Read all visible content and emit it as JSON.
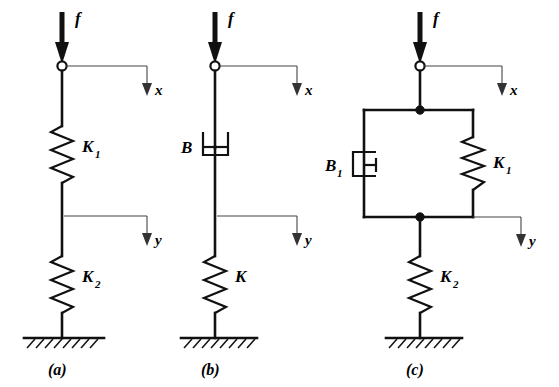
{
  "figure": {
    "background_color": "#ffffff",
    "line_color": "#111111",
    "leader_color": "#444444"
  },
  "panels": [
    {
      "id": "a",
      "caption": "(a)",
      "force_label": "f",
      "input_node": "open-circle",
      "displacement_top": "x",
      "displacement_bottom": "y",
      "elements": [
        {
          "kind": "spring",
          "label": "K",
          "subscript": "1"
        },
        {
          "kind": "spring",
          "label": "K",
          "subscript": "2"
        }
      ],
      "ground": "hatched-fixed-support"
    },
    {
      "id": "b",
      "caption": "(b)",
      "force_label": "f",
      "input_node": "open-circle",
      "displacement_top": "x",
      "displacement_bottom": "y",
      "elements": [
        {
          "kind": "damper",
          "label": "B",
          "subscript": ""
        },
        {
          "kind": "spring",
          "label": "K",
          "subscript": ""
        }
      ],
      "ground": "hatched-fixed-support"
    },
    {
      "id": "c",
      "caption": "(c)",
      "force_label": "f",
      "input_node": "open-circle",
      "displacement_top": "x",
      "displacement_bottom": "y",
      "elements": [
        {
          "kind": "damper",
          "label": "B",
          "subscript": "1",
          "arrangement": "parallel-left"
        },
        {
          "kind": "spring",
          "label": "K",
          "subscript": "1",
          "arrangement": "parallel-right"
        },
        {
          "kind": "spring",
          "label": "K",
          "subscript": "2",
          "arrangement": "series-below"
        }
      ],
      "ground": "hatched-fixed-support"
    }
  ]
}
